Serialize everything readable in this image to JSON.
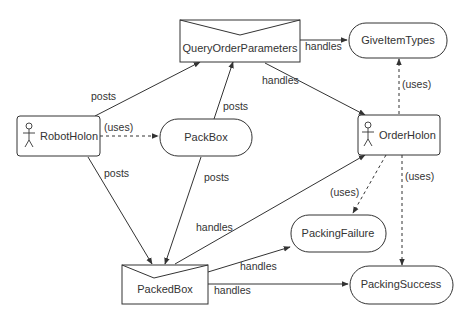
{
  "diagram": {
    "nodes": {
      "query_order_parameters": {
        "label": "QueryOrderParameters",
        "type": "message"
      },
      "give_item_types": {
        "label": "GiveItemTypes",
        "type": "task"
      },
      "robot_holon": {
        "label": "RobotHolon",
        "type": "actor"
      },
      "pack_box": {
        "label": "PackBox",
        "type": "task"
      },
      "order_holon": {
        "label": "OrderHolon",
        "type": "actor"
      },
      "packing_failure": {
        "label": "PackingFailure",
        "type": "task"
      },
      "packed_box": {
        "label": "PackedBox",
        "type": "message"
      },
      "packing_success": {
        "label": "PackingSuccess",
        "type": "task"
      }
    },
    "edges": [
      {
        "from": "QueryOrderParameters",
        "to": "GiveItemTypes",
        "label": "handles",
        "style": "solid"
      },
      {
        "from": "QueryOrderParameters",
        "to": "OrderHolon",
        "label": "handles",
        "style": "solid"
      },
      {
        "from": "RobotHolon",
        "to": "QueryOrderParameters",
        "label": "posts",
        "style": "solid"
      },
      {
        "from": "PackBox",
        "to": "QueryOrderParameters",
        "label": "posts",
        "style": "solid"
      },
      {
        "from": "RobotHolon",
        "to": "PackBox",
        "label": "(uses)",
        "style": "dashed"
      },
      {
        "from": "OrderHolon",
        "to": "GiveItemTypes",
        "label": "(uses)",
        "style": "dashed"
      },
      {
        "from": "RobotHolon",
        "to": "PackedBox",
        "label": "posts",
        "style": "solid"
      },
      {
        "from": "PackBox",
        "to": "PackedBox",
        "label": "posts",
        "style": "solid"
      },
      {
        "from": "PackedBox",
        "to": "OrderHolon",
        "label": "handles",
        "style": "solid"
      },
      {
        "from": "OrderHolon",
        "to": "PackingFailure",
        "label": "(uses)",
        "style": "dashed"
      },
      {
        "from": "OrderHolon",
        "to": "PackingSuccess",
        "label": "(uses)",
        "style": "dashed"
      },
      {
        "from": "PackedBox",
        "to": "PackingFailure",
        "label": "handles",
        "style": "solid"
      },
      {
        "from": "PackedBox",
        "to": "PackingSuccess",
        "label": "handles",
        "style": "solid"
      }
    ]
  }
}
